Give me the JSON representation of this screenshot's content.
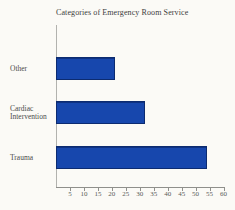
{
  "chart_data": {
    "type": "bar",
    "orientation": "horizontal",
    "title": "Categories of Emergency Room Service",
    "categories": [
      "Other",
      "Cardiac Intervention",
      "Trauma"
    ],
    "values": [
      21,
      32,
      54
    ],
    "xlabel": "",
    "ylabel": "",
    "xlim": [
      0,
      60
    ],
    "x_ticks": [
      5,
      10,
      15,
      20,
      25,
      30,
      35,
      40,
      45,
      50,
      55,
      60
    ],
    "grid": false,
    "legend": false,
    "data_labels": false,
    "colors": {
      "bar_fill": "#1747ad",
      "bar_border": "#0c2b70",
      "axis": "#8f8f8b",
      "title_text": "#3c3c3c",
      "category_text": "#4a4a4a",
      "tick_text": "#5a5a58",
      "background": "#fbfaf6"
    }
  }
}
